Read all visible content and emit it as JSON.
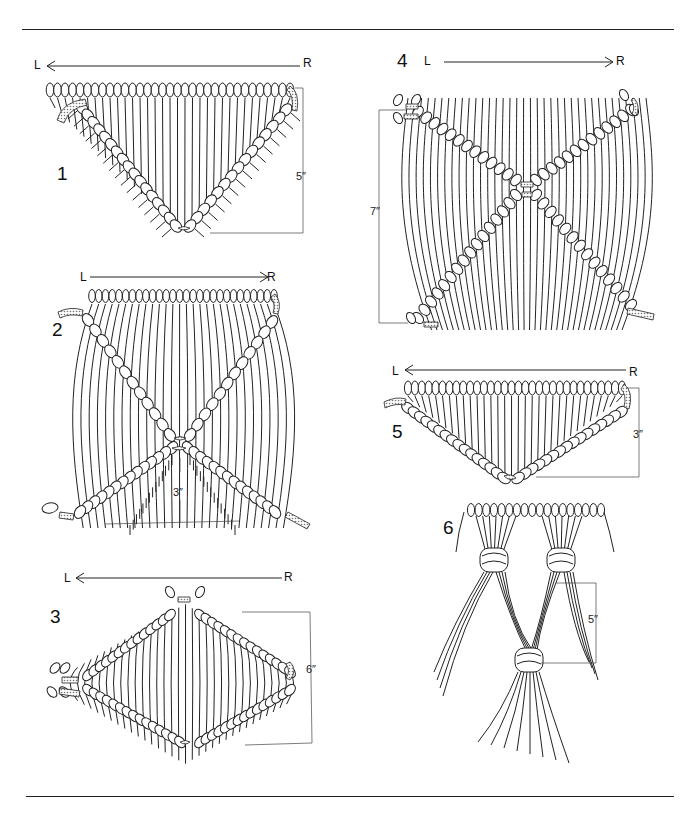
{
  "page": {
    "colors": {
      "ink": "#1a1a1a",
      "paper": "#ffffff",
      "shade": "#b5b5b5"
    }
  },
  "figures": [
    {
      "number": "1",
      "direction": {
        "from": "R",
        "to": "L",
        "left_label": "L",
        "right_label": "R"
      },
      "measurement": "5″",
      "shape": "inverted triangle of diagonal double half hitches"
    },
    {
      "number": "2",
      "direction": {
        "from": "L",
        "to": "R",
        "left_label": "L",
        "right_label": "R"
      },
      "measurement": "3″",
      "shape": "X crossing of diagonal double half hitches"
    },
    {
      "number": "3",
      "direction": {
        "from": "R",
        "to": "L",
        "left_label": "L",
        "right_label": "R"
      },
      "measurement": "6″",
      "shape": "diamond of diagonal double half hitches"
    },
    {
      "number": "4",
      "direction": {
        "from": "L",
        "to": "R",
        "left_label": "L",
        "right_label": "R"
      },
      "measurement": "7″",
      "shape": "X crossing, cords continuing down"
    },
    {
      "number": "5",
      "direction": {
        "from": "R",
        "to": "L",
        "left_label": "L",
        "right_label": "R"
      },
      "measurement": "3″",
      "shape": "shallow inverted triangle"
    },
    {
      "number": "6",
      "direction": null,
      "measurement": "5″",
      "shape": "three gathering knots in alternating pattern"
    }
  ]
}
